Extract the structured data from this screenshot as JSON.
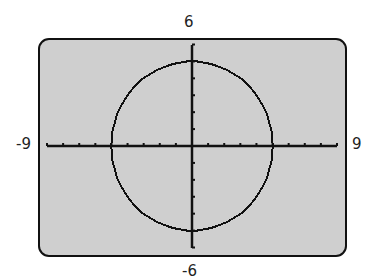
{
  "window": {
    "xmin_label": "-9",
    "xmax_label": "9",
    "ymax_label": "6",
    "ymin_label": "-6"
  },
  "colors": {
    "screen_fill": "#cfcfcf",
    "ink": "#111111"
  },
  "chart_data": {
    "type": "line",
    "title": "",
    "xlabel": "",
    "ylabel": "",
    "xlim": [
      -9,
      9
    ],
    "ylim": [
      -6,
      6
    ],
    "xscale": 1,
    "yscale": 1,
    "grid": false,
    "series": [
      {
        "name": "circle",
        "equation": "x^2 + y^2 = 25",
        "center": [
          0,
          0
        ],
        "radius": 5,
        "x": [
          5,
          4,
          3,
          0,
          -3,
          -4,
          -5,
          -4,
          -3,
          0,
          3,
          4,
          5
        ],
        "y": [
          0,
          3,
          4,
          5,
          4,
          3,
          0,
          -3,
          -4,
          -5,
          -4,
          -3,
          0
        ]
      }
    ],
    "tick_labels": {
      "left": "-9",
      "right": "9",
      "top": "6",
      "bottom": "-6"
    }
  }
}
